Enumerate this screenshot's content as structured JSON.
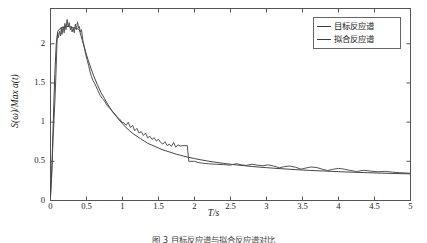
{
  "chart_data": {
    "type": "line",
    "title": "",
    "xlabel": "T/s",
    "ylabel": "S(ω)/Max a(t)",
    "xlim": [
      0,
      5
    ],
    "ylim": [
      0,
      2.45
    ],
    "xticks": [
      "0",
      "0.5",
      "1",
      "1.5",
      "2",
      "2.5",
      "3",
      "3.5",
      "4",
      "4.5",
      "5"
    ],
    "xtick_values": [
      0,
      0.5,
      1,
      1.5,
      2,
      2.5,
      3,
      3.5,
      4,
      4.5,
      5
    ],
    "yticks": [
      "0",
      "0.5",
      "1",
      "1.5",
      "2"
    ],
    "ytick_values": [
      0,
      0.5,
      1,
      1.5,
      2
    ],
    "grid": false,
    "legend_position": "top-right",
    "series": [
      {
        "name": "目标反应谱",
        "color": "#3a3a3a",
        "x": [
          0.0,
          0.02,
          0.04,
          0.06,
          0.08,
          0.1,
          0.14,
          0.18,
          0.22,
          0.26,
          0.3,
          0.34,
          0.38,
          0.4,
          0.44,
          0.48,
          0.52,
          0.56,
          0.6,
          0.65,
          0.7,
          0.75,
          0.8,
          0.85,
          0.9,
          0.95,
          1.0,
          1.05,
          1.1,
          1.15,
          1.2,
          1.25,
          1.3,
          1.35,
          1.4,
          1.45,
          1.5,
          1.55,
          1.6,
          1.65,
          1.7,
          1.75,
          1.8,
          1.85,
          1.9,
          1.95,
          2.0,
          2.1,
          2.2,
          2.3,
          2.4,
          2.5,
          2.6,
          2.7,
          2.8,
          2.9,
          3.0,
          3.1,
          3.2,
          3.3,
          3.4,
          3.5,
          3.6,
          3.7,
          3.8,
          3.9,
          4.0,
          4.2,
          4.4,
          4.6,
          4.8,
          5.0
        ],
        "y": [
          0.05,
          0.45,
          1.05,
          1.62,
          2.0,
          2.16,
          2.2,
          2.21,
          2.22,
          2.22,
          2.21,
          2.2,
          2.19,
          2.18,
          2.05,
          1.92,
          1.8,
          1.69,
          1.59,
          1.48,
          1.38,
          1.3,
          1.22,
          1.15,
          1.09,
          1.03,
          0.98,
          0.93,
          0.89,
          0.85,
          0.82,
          0.79,
          0.76,
          0.73,
          0.71,
          0.69,
          0.67,
          0.65,
          0.635,
          0.62,
          0.605,
          0.59,
          0.578,
          0.566,
          0.555,
          0.545,
          0.535,
          0.517,
          0.501,
          0.487,
          0.474,
          0.463,
          0.452,
          0.443,
          0.434,
          0.426,
          0.419,
          0.412,
          0.406,
          0.4,
          0.394,
          0.389,
          0.384,
          0.38,
          0.376,
          0.372,
          0.368,
          0.361,
          0.355,
          0.349,
          0.344,
          0.34
        ]
      },
      {
        "name": "拟合反应谱",
        "color": "#4a4a4a",
        "x": [
          0.0,
          0.02,
          0.035,
          0.05,
          0.065,
          0.08,
          0.09,
          0.1,
          0.11,
          0.125,
          0.14,
          0.15,
          0.16,
          0.175,
          0.19,
          0.2,
          0.215,
          0.23,
          0.245,
          0.26,
          0.275,
          0.29,
          0.3,
          0.315,
          0.33,
          0.345,
          0.36,
          0.375,
          0.39,
          0.4,
          0.415,
          0.43,
          0.45,
          0.47,
          0.49,
          0.51,
          0.53,
          0.55,
          0.57,
          0.59,
          0.61,
          0.63,
          0.66,
          0.69,
          0.72,
          0.75,
          0.78,
          0.81,
          0.84,
          0.87,
          0.9,
          0.93,
          0.96,
          0.99,
          1.02,
          1.05,
          1.08,
          1.11,
          1.14,
          1.17,
          1.2,
          1.23,
          1.26,
          1.29,
          1.32,
          1.35,
          1.38,
          1.41,
          1.44,
          1.47,
          1.5,
          1.53,
          1.56,
          1.59,
          1.62,
          1.65,
          1.68,
          1.71,
          1.74,
          1.77,
          1.8,
          1.84,
          1.88,
          1.9,
          1.92,
          1.95,
          2.0,
          2.05,
          2.12,
          2.2,
          2.3,
          2.4,
          2.5,
          2.58,
          2.65,
          2.72,
          2.8,
          2.88,
          2.95,
          3.02,
          3.1,
          3.18,
          3.25,
          3.32,
          3.4,
          3.48,
          3.55,
          3.62,
          3.7,
          3.78,
          3.85,
          3.92,
          4.0,
          4.08,
          4.15,
          4.25,
          4.35,
          4.45,
          4.55,
          4.65,
          4.75,
          4.85,
          5.0
        ],
        "y": [
          0.04,
          0.38,
          0.78,
          1.05,
          1.35,
          1.72,
          2.02,
          2.14,
          2.08,
          2.16,
          2.1,
          2.21,
          2.12,
          2.22,
          2.14,
          2.26,
          2.18,
          2.31,
          2.22,
          2.27,
          2.18,
          2.22,
          2.15,
          2.2,
          2.14,
          2.25,
          2.18,
          2.28,
          2.2,
          2.22,
          2.15,
          2.18,
          2.04,
          1.96,
          1.86,
          1.79,
          1.72,
          1.64,
          1.58,
          1.53,
          1.5,
          1.46,
          1.4,
          1.34,
          1.3,
          1.27,
          1.22,
          1.19,
          1.16,
          1.12,
          1.1,
          1.06,
          1.04,
          1.0,
          0.99,
          0.96,
          1.0,
          0.93,
          0.96,
          0.89,
          0.92,
          0.86,
          0.88,
          0.83,
          0.86,
          0.8,
          0.82,
          0.78,
          0.8,
          0.76,
          0.78,
          0.74,
          0.72,
          0.75,
          0.7,
          0.72,
          0.69,
          0.74,
          0.68,
          0.71,
          0.695,
          0.7,
          0.7,
          0.7,
          0.5,
          0.5,
          0.5,
          0.485,
          0.475,
          0.468,
          0.462,
          0.458,
          0.452,
          0.47,
          0.455,
          0.448,
          0.462,
          0.45,
          0.443,
          0.455,
          0.44,
          0.418,
          0.432,
          0.44,
          0.425,
          0.4,
          0.415,
          0.428,
          0.42,
          0.398,
          0.382,
          0.398,
          0.41,
          0.4,
          0.386,
          0.37,
          0.385,
          0.375,
          0.366,
          0.372,
          0.362,
          0.355,
          0.348
        ]
      }
    ]
  },
  "axes": {
    "xlabel": "T/s",
    "ylabel": "S(ω)/Max a(t)"
  },
  "legend": {
    "entries": [
      {
        "label": "目标反应谱"
      },
      {
        "label": "拟合反应谱"
      }
    ]
  },
  "caption": {
    "text": "图 3 目标反应谱与拟合反应谱对比"
  },
  "colors": {
    "target_line": "#3a3a3a",
    "fitted_line": "#4a4a4a",
    "axis": "#555555",
    "text": "#1a1a1a"
  }
}
